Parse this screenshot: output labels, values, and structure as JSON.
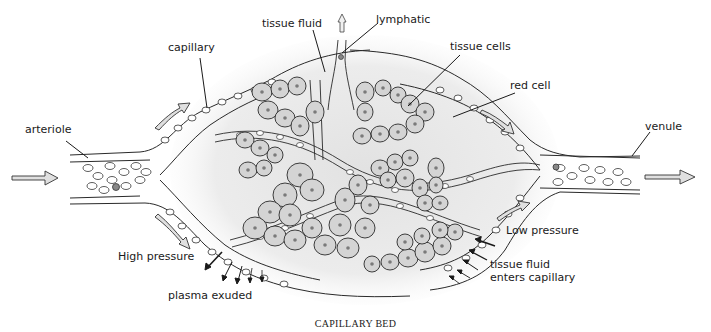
{
  "figure": {
    "caption": "CAPILLARY BED",
    "colors": {
      "line": "#2a2a2a",
      "cell_fill": "#d4d4d4",
      "nucleus": "#7a7a7a",
      "stipple": "#e6e6e6",
      "arrow_fill": "#e0e0e0",
      "background": "#ffffff"
    }
  },
  "labels": {
    "tissue_fluid": "tissue fluid",
    "lymphatic": "lymphatic",
    "capillary": "capillary",
    "tissue_cells": "tissue cells",
    "red_cell": "red cell",
    "arteriole": "arteriole",
    "venule": "venule",
    "high_pressure": "High pressure",
    "low_pressure": "Low pressure",
    "plasma_exuded": "plasma exuded",
    "tissue_fluid_enters_1": "tissue fluid",
    "tissue_fluid_enters_2": "enters capillary"
  },
  "flow": {
    "inflow": "arteriole-to-capillaries",
    "outflow": "capillaries-to-venule",
    "lymph_drain": "upward"
  }
}
